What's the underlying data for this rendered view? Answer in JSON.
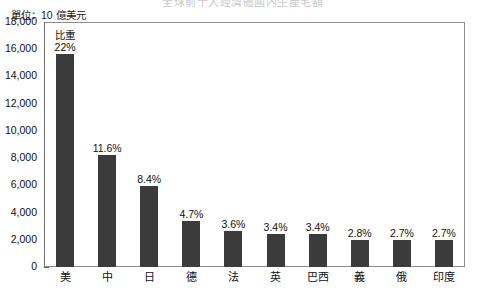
{
  "chart_data": {
    "type": "bar",
    "title": "全球前十大經濟體國內生產毛額",
    "unit_label": "單位：10 億美元",
    "categories": [
      "美",
      "中",
      "日",
      "德",
      "法",
      "英",
      "巴西",
      "義",
      "俄",
      "印度"
    ],
    "values": [
      15650,
      8230,
      5960,
      3400,
      2610,
      2440,
      2430,
      2010,
      1950,
      1950
    ],
    "data_labels": [
      "22%",
      "11.6%",
      "8.4%",
      "4.7%",
      "3.6%",
      "3.4%",
      "3.4%",
      "2.8%",
      "2.7%",
      "2.7%"
    ],
    "first_bar_note": "比重",
    "xlabel": "",
    "ylabel": "",
    "ylim": [
      0,
      18000
    ],
    "ytick_values": [
      18000,
      16000,
      14000,
      12000,
      10000,
      8000,
      6000,
      4000,
      2000,
      0
    ],
    "ytick_labels": [
      "18,000",
      "16,000",
      "14,000",
      "12,000",
      "10,000",
      "8,000",
      "6,000",
      "4,000",
      "2,000",
      "0"
    ],
    "grid": false,
    "legend": "none",
    "bar_color": "#3b3b3b",
    "axis_color": "#8d8d8d",
    "background_color": "#ffffff"
  }
}
